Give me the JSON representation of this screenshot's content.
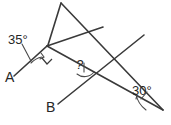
{
  "figure": {
    "type": "geometric-diagram",
    "background_color": "#ffffff",
    "stroke_color": "#3a3a3a",
    "label_color": "#262626",
    "width": 171,
    "height": 125
  },
  "labels": {
    "angle_left": "35°",
    "angle_right": "30°",
    "point_a": "A",
    "point_b": "B",
    "unknown_angle": "?"
  },
  "angles": [
    {
      "name": "angle-at-A",
      "value": "35°",
      "degrees": 35,
      "marker": "arc"
    },
    {
      "name": "angle-at-right-vertex",
      "value": "30°",
      "degrees": 30,
      "marker": "arc"
    },
    {
      "name": "angle-unknown",
      "value": "?",
      "degrees": null,
      "marker": "arc"
    },
    {
      "name": "angle-right-angle",
      "value": "90°",
      "degrees": 90,
      "marker": "square"
    }
  ],
  "points": [
    {
      "id": "A",
      "label": "A",
      "x": 18,
      "y": 72
    },
    {
      "id": "B",
      "label": "B",
      "x": 56,
      "y": 104
    },
    {
      "id": "P",
      "label": "",
      "x": 48,
      "y": 45
    },
    {
      "id": "T",
      "label": "",
      "x": 62,
      "y": 3
    },
    {
      "id": "Q",
      "label": "",
      "x": 160,
      "y": 108
    },
    {
      "id": "X",
      "label": "",
      "x": 88,
      "y": 79
    },
    {
      "id": "R",
      "label": "",
      "x": 137,
      "y": 39
    },
    {
      "id": "S",
      "label": "",
      "x": 98,
      "y": 31
    }
  ],
  "segments": [
    {
      "name": "ray-A-through-P-to-T",
      "from": "A",
      "to": "T"
    },
    {
      "name": "line-P-to-Q",
      "from": "P",
      "to": "Q"
    },
    {
      "name": "line-T-to-Q",
      "from": "T",
      "to": "Q"
    },
    {
      "name": "line-B-to-R",
      "from": "B",
      "to": "R"
    },
    {
      "name": "segment-S-to-P",
      "from": "S",
      "to": "P"
    }
  ]
}
